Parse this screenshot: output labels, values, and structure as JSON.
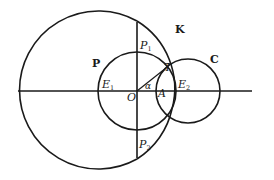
{
  "diagram": {
    "circles": {
      "K": {
        "label": "K",
        "cx": 98,
        "cy": 90,
        "r": 79
      },
      "P": {
        "label": "P",
        "cx": 137,
        "cy": 91,
        "r": 39
      },
      "C": {
        "label": "C",
        "cx": 188,
        "cy": 91,
        "r": 32
      }
    },
    "points": {
      "O": {
        "label": "O"
      },
      "A": {
        "label": "A"
      },
      "T": {
        "label": "T"
      },
      "E1": {
        "label": "E",
        "sub": "1"
      },
      "E2": {
        "label": "E",
        "sub": "2"
      },
      "P1": {
        "label": "P",
        "sub": "1"
      },
      "P2": {
        "label": "P",
        "sub": "2"
      }
    },
    "angle": {
      "label": "α"
    },
    "colors": {
      "stroke": "#1a1a1a",
      "background": "#ffffff"
    }
  }
}
